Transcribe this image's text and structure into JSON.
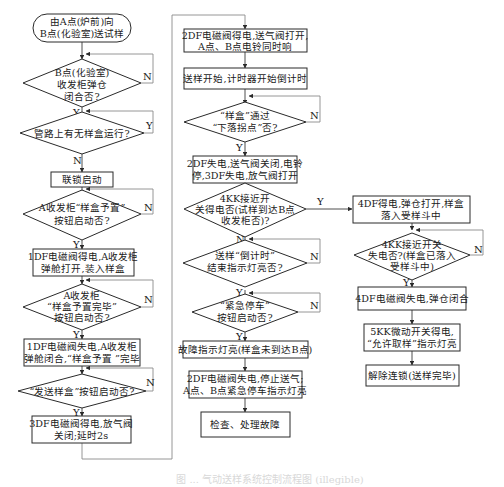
{
  "diagram": {
    "type": "flowchart",
    "caption": "图 ... 气动送样系统控制流程图 (illegible)",
    "colors": {
      "stroke": "#2a2a2a",
      "line": "#3a3a3a",
      "loop": "#8a8a8a",
      "background": "#ffffff"
    }
  },
  "labels": {
    "yes": "Y",
    "no": "N"
  },
  "nodes": {
    "start": {
      "shape": "terminal",
      "lines": [
        "由A点(炉前)向",
        "B点(化验室)送试样"
      ]
    },
    "d_b_cabinet_closed": {
      "shape": "decision",
      "lines": [
        "B点(化验室)",
        "收发柜弹仓",
        "闭合否?"
      ]
    },
    "d_pipeline_busy": {
      "shape": "decision",
      "lines": [
        "管路上有无样盒运行?"
      ]
    },
    "p_interlock": {
      "shape": "process",
      "lines": [
        "联锁启动"
      ]
    },
    "d_preset_button": {
      "shape": "decision",
      "lines": [
        "A收发柜“样盒予置”",
        "按钮启动否?"
      ]
    },
    "p_1df_on": {
      "shape": "process",
      "lines": [
        "1DF电磁阀得电,A收发柜",
        "弹舱打开,装入样盒"
      ]
    },
    "d_preset_done": {
      "shape": "decision",
      "lines": [
        "A收发柜",
        "“样盒予置完毕”",
        "按钮启动否?"
      ]
    },
    "p_1df_off": {
      "shape": "process",
      "lines": [
        "1DF电磁阀失电,A收发柜",
        "弹舱闭合,“样盒予置 ”完毕"
      ]
    },
    "d_send_button": {
      "shape": "decision",
      "lines": [
        "“发送样盒”按钮启动否?"
      ]
    },
    "p_3df_on": {
      "shape": "process",
      "lines": [
        "3DF电磁阀得电,放气阀",
        "关闭;延时2s"
      ]
    },
    "p_2df_on": {
      "shape": "process",
      "lines": [
        "2DF电磁阀得电,送气阀打开,",
        "A点、B点电铃同时响"
      ]
    },
    "p_timer": {
      "shape": "process",
      "lines": [
        "送样开始,计时器开始倒计时"
      ]
    },
    "d_drop_point": {
      "shape": "decision",
      "lines": [
        "“样盒”通过",
        "“下落拐点”否?"
      ]
    },
    "p_2df_off": {
      "shape": "process",
      "lines": [
        "2DF失电,送气阀关闭,电铃",
        "停,3DF失电,放气阀打开"
      ]
    },
    "d_4kk_on": {
      "shape": "decision",
      "lines": [
        "4KK接近开",
        "关得电否(试样到达B点",
        "收发柜否)?"
      ]
    },
    "d_countdown_end": {
      "shape": "decision",
      "lines": [
        "送样“倒计时”",
        "结束指示灯亮否?"
      ]
    },
    "d_emergency": {
      "shape": "decision",
      "lines": [
        "“紧急停车”",
        "按钮启动否?"
      ]
    },
    "p_fault_light": {
      "shape": "process",
      "lines": [
        "故障指示灯亮(样盒未到达B点)"
      ]
    },
    "p_2df_stop": {
      "shape": "process",
      "lines": [
        "2DF电磁阀失电,停止送气;",
        "A点、B点紧急停车指示灯亮"
      ]
    },
    "p_check": {
      "shape": "process",
      "lines": [
        "检查、处理故障"
      ]
    },
    "p_4df_on": {
      "shape": "process",
      "lines": [
        "4DF得电,弹仓打开,样盒",
        "落入受样斗中"
      ]
    },
    "d_4kk_off": {
      "shape": "decision",
      "lines": [
        "4KK接近开关",
        "失电否?(样盒已落入",
        "受样斗中)"
      ]
    },
    "p_4df_off": {
      "shape": "process",
      "lines": [
        "4DF电磁阀失电,弹仓闭合"
      ]
    },
    "p_5kk_on": {
      "shape": "process",
      "lines": [
        "5KK微动开关得电,",
        "“允许取样”指示灯亮"
      ]
    },
    "p_release": {
      "shape": "process",
      "lines": [
        "解除连锁(送样完毕)"
      ]
    }
  },
  "edges": [
    [
      "start",
      "d_b_cabinet_closed",
      ""
    ],
    [
      "d_b_cabinet_closed",
      "d_b_cabinet_closed",
      "N"
    ],
    [
      "d_b_cabinet_closed",
      "d_pipeline_busy",
      "Y"
    ],
    [
      "d_pipeline_busy",
      "d_pipeline_busy",
      "Y"
    ],
    [
      "d_pipeline_busy",
      "p_interlock",
      "N"
    ],
    [
      "p_interlock",
      "d_preset_button",
      ""
    ],
    [
      "d_preset_button",
      "d_preset_button",
      "N"
    ],
    [
      "d_preset_button",
      "p_1df_on",
      "Y"
    ],
    [
      "p_1df_on",
      "d_preset_done",
      ""
    ],
    [
      "d_preset_done",
      "d_preset_done",
      "N"
    ],
    [
      "d_preset_done",
      "p_1df_off",
      "Y"
    ],
    [
      "p_1df_off",
      "d_send_button",
      ""
    ],
    [
      "d_send_button",
      "d_send_button",
      "N"
    ],
    [
      "d_send_button",
      "p_3df_on",
      "Y"
    ],
    [
      "p_3df_on",
      "p_2df_on",
      ""
    ],
    [
      "p_2df_on",
      "p_timer",
      ""
    ],
    [
      "p_timer",
      "d_drop_point",
      ""
    ],
    [
      "d_drop_point",
      "d_drop_point",
      "N"
    ],
    [
      "d_drop_point",
      "p_2df_off",
      "Y"
    ],
    [
      "p_2df_off",
      "d_4kk_on",
      ""
    ],
    [
      "d_4kk_on",
      "p_4df_on",
      "Y"
    ],
    [
      "d_4kk_on",
      "d_countdown_end",
      "N"
    ],
    [
      "d_countdown_end",
      "d_4kk_on",
      "N"
    ],
    [
      "d_countdown_end",
      "d_emergency",
      "Y"
    ],
    [
      "d_emergency",
      "d_emergency",
      "N"
    ],
    [
      "d_emergency",
      "p_fault_light",
      "Y"
    ],
    [
      "p_fault_light",
      "p_2df_stop",
      ""
    ],
    [
      "p_2df_stop",
      "p_check",
      ""
    ],
    [
      "p_4df_on",
      "d_4kk_off",
      ""
    ],
    [
      "d_4kk_off",
      "d_4kk_off",
      "N"
    ],
    [
      "d_4kk_off",
      "p_4df_off",
      "Y"
    ],
    [
      "p_4df_off",
      "p_5kk_on",
      ""
    ],
    [
      "p_5kk_on",
      "p_release",
      ""
    ]
  ]
}
